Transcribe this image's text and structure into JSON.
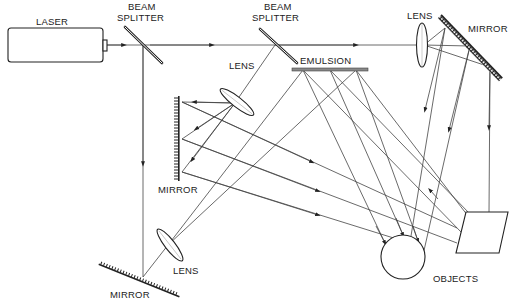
{
  "diagram": {
    "labels": {
      "laser": "LASER",
      "beam_splitter_1_line1": "BEAM",
      "beam_splitter_1_line2": "SPLITTER",
      "beam_splitter_2_line1": "BEAM",
      "beam_splitter_2_line2": "SPLITTER",
      "lens_top_right": "LENS",
      "mirror_top_right": "MIRROR",
      "lens_middle": "LENS",
      "emulsion": "EMULSION",
      "mirror_left": "MIRROR",
      "lens_bottom": "LENS",
      "mirror_bottom": "MIRROR",
      "objects": "OBJECTS"
    },
    "components": [
      {
        "name": "laser",
        "type": "source"
      },
      {
        "name": "beam-splitter-1",
        "type": "beam splitter"
      },
      {
        "name": "beam-splitter-2",
        "type": "beam splitter"
      },
      {
        "name": "lens-top-right",
        "type": "lens"
      },
      {
        "name": "mirror-top-right",
        "type": "mirror"
      },
      {
        "name": "lens-middle",
        "type": "lens"
      },
      {
        "name": "mirror-left",
        "type": "mirror"
      },
      {
        "name": "emulsion",
        "type": "recording plate"
      },
      {
        "name": "lens-bottom",
        "type": "lens"
      },
      {
        "name": "mirror-bottom",
        "type": "mirror"
      },
      {
        "name": "object-sphere",
        "type": "object"
      },
      {
        "name": "object-block",
        "type": "object"
      }
    ],
    "colors": {
      "line": "#444444",
      "ink": "#222222",
      "background": "#ffffff"
    }
  }
}
